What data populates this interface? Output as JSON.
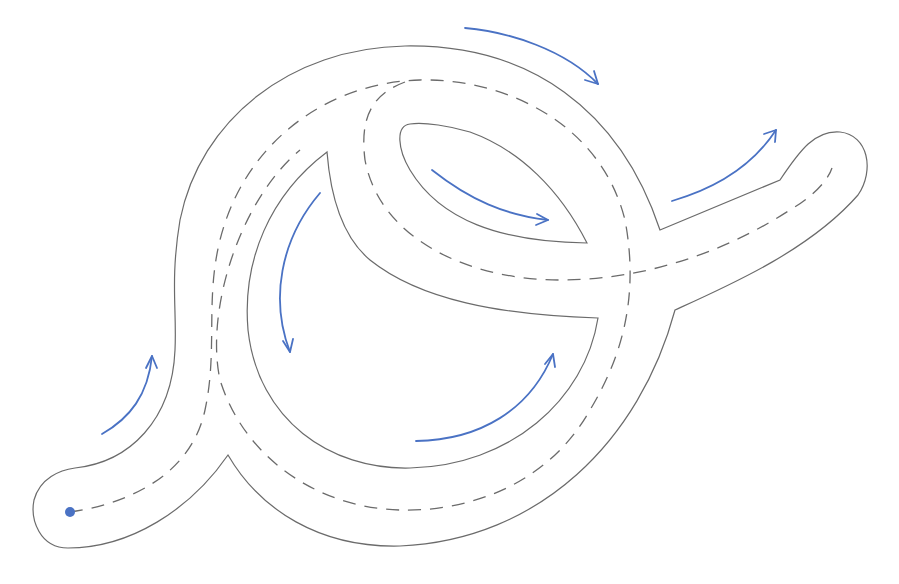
{
  "diagram": {
    "title": "",
    "type": "track-route",
    "colors": {
      "edge": "#6b6b6b",
      "centerline": "#6b6b6b",
      "arrow": "#4a72c4",
      "start": "#4a72c4",
      "background": "#ffffff"
    },
    "start_point": {
      "x": 70,
      "y": 512,
      "r": 5
    },
    "outer_edge": "M 68 548 C 40 548 30 520 34 500 C 40 478 60 470 75 468 C 130 462 172 420 175 350 C 177 310 170 280 180 220 C 200 120 290 48 405 46 C 530 44 620 110 660 230 L 780 180 C 800 150 815 130 840 132 C 868 135 875 170 858 195 C 810 250 730 285 675 310 C 640 440 540 540 400 546 C 320 548 260 510 228 455 C 190 510 130 548 68 548 Z",
    "inner_edges": [
      "M 327 152 C 270 195 242 260 248 330 C 258 420 330 470 410 468 C 510 466 585 400 598 318 C 500 315 420 300 370 260 C 340 235 330 190 327 152 Z",
      "M 410 124 C 395 126 398 150 410 170 C 440 220 500 242 587 243 C 560 190 520 150 470 132 C 450 126 425 122 410 124 Z"
    ],
    "centerline": "M 70 512 C 120 505 190 480 205 410 C 218 350 205 300 220 240 C 245 140 330 82 420 80 C 500 78 600 120 625 220 C 640 300 620 360 590 410 C 545 490 460 512 400 510 C 320 508 245 460 220 380 C 205 310 240 200 300 150",
    "centerline_branch": "M 405 82 C 370 95 360 120 365 160 C 380 240 470 280 560 280 C 640 280 720 255 790 210 C 815 195 828 180 832 168",
    "arrows": [
      {
        "name": "arrow-lower-left",
        "path": "M 102 434 C 130 418 148 395 152 356",
        "head": "M 146 368 L 152 356 L 157 368"
      },
      {
        "name": "arrow-top",
        "path": "M 465 28 C 510 32 565 50 598 84",
        "head": "M 585 80 L 598 84 L 594 71"
      },
      {
        "name": "arrow-loop-left",
        "path": "M 320 193 C 280 240 270 300 290 352",
        "head": "M 283 341 L 290 352 L 293 339"
      },
      {
        "name": "arrow-inner-leaf",
        "path": "M 432 170 C 470 200 505 215 548 220",
        "head": "M 537 214 L 548 220 L 536 225"
      },
      {
        "name": "arrow-right-exit",
        "path": "M 672 201 C 710 190 750 170 776 130",
        "head": "M 764 134 L 776 130 L 775 142"
      },
      {
        "name": "arrow-loop-bottom",
        "path": "M 416 441 C 480 440 530 410 553 354",
        "head": "M 545 364 L 553 354 L 555 367"
      }
    ]
  }
}
